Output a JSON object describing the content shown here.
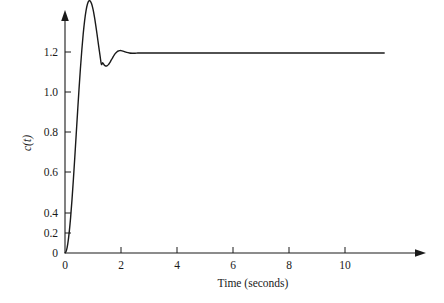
{
  "chart_data": {
    "type": "line",
    "title": "",
    "subtitle": "",
    "xlabel": "Time (seconds)",
    "ylabel": "c(t)",
    "xlim": [
      0,
      11.4
    ],
    "ylim": [
      0,
      1.34
    ],
    "grid": false,
    "legend": null,
    "xticks": [
      0,
      2,
      4,
      6,
      8,
      10
    ],
    "xtick_labels": [
      "0",
      "2",
      "4",
      "6",
      "8",
      "10"
    ],
    "yticks": [
      0,
      0.2,
      0.4,
      0.6,
      0.8,
      1.0,
      1.2
    ],
    "ytick_labels": [
      "0",
      "0.2",
      "0.4",
      "0.6",
      "0.8",
      "1.0",
      "1.2"
    ],
    "series": [
      {
        "name": "c(t)",
        "color": "#1a1a1a",
        "x": [
          0.0,
          0.05,
          0.1,
          0.15,
          0.2,
          0.25,
          0.3,
          0.35,
          0.4,
          0.45,
          0.5,
          0.55,
          0.6,
          0.65,
          0.7,
          0.75,
          0.8,
          0.85,
          0.9,
          0.95,
          1.0,
          1.05,
          1.1,
          1.15,
          1.2,
          1.25,
          1.3,
          1.35,
          1.4,
          1.45,
          1.5,
          1.55,
          1.6,
          1.65,
          1.7,
          1.75,
          1.8,
          1.85,
          1.9,
          1.95,
          2.0,
          2.1,
          2.2,
          2.3,
          2.4,
          2.5,
          2.6,
          2.7,
          2.8,
          2.9,
          3.0,
          3.2,
          3.4,
          3.6,
          3.8,
          4.0,
          4.5,
          5.0,
          5.5,
          6.0,
          6.5,
          7.0,
          7.5,
          8.0,
          8.5,
          9.0,
          9.5,
          10.0,
          10.5,
          11.0,
          11.4
        ],
        "y": [
          0.0,
          0.012,
          0.047,
          0.103,
          0.177,
          0.267,
          0.369,
          0.479,
          0.593,
          0.707,
          0.818,
          0.921,
          1.014,
          1.095,
          1.161,
          1.211,
          1.244,
          1.26,
          1.26,
          1.246,
          1.219,
          1.182,
          1.137,
          1.088,
          1.037,
          0.988,
          0.944,
          0.951,
          0.94,
          0.935,
          0.936,
          0.942,
          0.952,
          0.964,
          0.976,
          0.988,
          0.998,
          1.005,
          1.01,
          1.012,
          1.012,
          1.008,
          1.003,
          1.0,
          0.999,
          0.999,
          1.0,
          1.0,
          1.0,
          1.0,
          1.0,
          1.0,
          1.0,
          1.0,
          1.0,
          1.0,
          1.0,
          1.0,
          1.0,
          1.0,
          1.0,
          1.0,
          1.0,
          1.0,
          1.0,
          1.0,
          1.0,
          1.0,
          1.0,
          1.0,
          1.0
        ]
      }
    ],
    "annotations": {
      "peak_value": 1.26,
      "peak_time": 0.87,
      "undershoot_value": 0.935,
      "undershoot_time": 1.45,
      "steady_state": 1.0
    }
  }
}
